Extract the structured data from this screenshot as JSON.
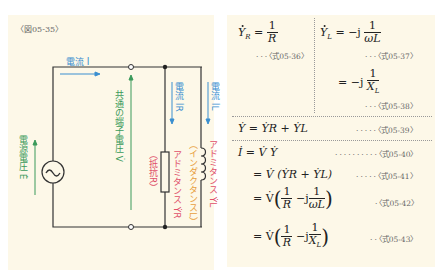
{
  "figure": {
    "label": "〈図05-35〉",
    "colors": {
      "background": "#fdf8e8",
      "wire": "#333333",
      "current_blue": "#3a8fd0",
      "voltage_green": "#3a9a5a",
      "admittance_red": "#e0506a",
      "element_orange": "#e8a040"
    },
    "labels": {
      "current_main": "電流 İ",
      "current_r": "電流 İR",
      "current_l": "電流 İL",
      "source_voltage": "電源電圧 Ė",
      "terminal_voltage": "共通の端子電圧 V̇",
      "resistor": "（抵抗R）",
      "inductor": "（インダクタンスL）",
      "admittance_r": "アドミタンス ẎR",
      "admittance_l": "アドミタンス ẎL"
    }
  },
  "equations": {
    "eq36": {
      "lhs": "Ẏ",
      "sub": "R",
      "num": "1",
      "den": "R",
      "ref": "〈式05-36〉"
    },
    "eq37": {
      "lhs": "Ẏ",
      "sub": "L",
      "pre": "= −j",
      "num": "1",
      "den": "ωL",
      "ref": "〈式05-37〉"
    },
    "eq38": {
      "pre": "= −j",
      "num": "1",
      "den": "X",
      "den_sub": "L",
      "ref": "〈式05-38〉"
    },
    "eq39": {
      "text": "Ẏ  = ẎR + ẎL",
      "ref": "〈式05-39〉"
    },
    "eq40": {
      "text": "İ  = V̇ Ẏ",
      "ref": "〈式05-40〉"
    },
    "eq41": {
      "text": "= V̇ (ẎR + ẎL)",
      "ref": "〈式05-41〉"
    },
    "eq42": {
      "pre": "= V̇",
      "num1": "1",
      "den1": "R",
      "mid": "−j",
      "num2": "1",
      "den2": "ωL",
      "ref": "〈式05-42〉"
    },
    "eq43": {
      "pre": "= V̇",
      "num1": "1",
      "den1": "R",
      "mid": "−j",
      "num2": "1",
      "den2": "X",
      "den2_sub": "L",
      "ref": "〈式05-43〉"
    }
  }
}
